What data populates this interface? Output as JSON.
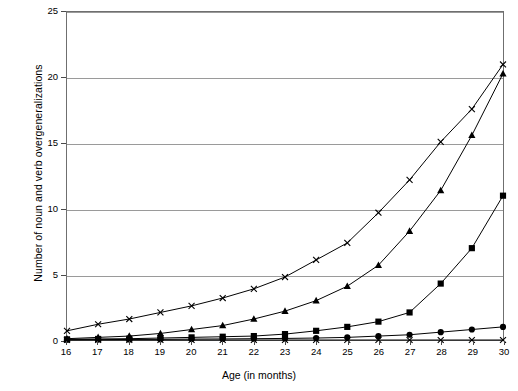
{
  "chart_data": {
    "type": "line",
    "title": "",
    "xlabel": "Age (in months)",
    "ylabel": "Number of noun and verb overgeneralizations",
    "x": [
      16,
      17,
      18,
      19,
      20,
      21,
      22,
      23,
      24,
      25,
      26,
      27,
      28,
      29,
      30
    ],
    "xlim": [
      16,
      30
    ],
    "ylim": [
      0,
      25
    ],
    "ytick_labels": [
      "0",
      "5",
      "10",
      "15",
      "20",
      "25"
    ],
    "ytick_values": [
      0,
      5,
      10,
      15,
      20,
      25
    ],
    "xtick_labels": [
      "16",
      "17",
      "18",
      "19",
      "20",
      "21",
      "22",
      "23",
      "24",
      "25",
      "26",
      "27",
      "28",
      "29",
      "30"
    ],
    "grid": "horizontal",
    "legend": "none",
    "series": [
      {
        "name": "series-cross-upper",
        "marker": "x",
        "values": [
          0.7,
          1.2,
          1.6,
          2.1,
          2.6,
          3.2,
          3.9,
          4.8,
          6.1,
          7.4,
          9.7,
          12.2,
          15.1,
          17.6,
          21.0
        ]
      },
      {
        "name": "series-triangle",
        "marker": "triangle",
        "values": [
          0.1,
          0.2,
          0.3,
          0.5,
          0.8,
          1.1,
          1.6,
          2.2,
          3.0,
          4.1,
          5.7,
          8.3,
          11.4,
          15.6,
          20.3
        ]
      },
      {
        "name": "series-square",
        "marker": "square",
        "values": [
          0.05,
          0.08,
          0.1,
          0.15,
          0.2,
          0.25,
          0.3,
          0.45,
          0.7,
          1.0,
          1.4,
          2.1,
          4.3,
          7.0,
          11.0
        ]
      },
      {
        "name": "series-circle",
        "marker": "circle",
        "values": [
          0.02,
          0.03,
          0.04,
          0.05,
          0.07,
          0.08,
          0.1,
          0.12,
          0.15,
          0.2,
          0.3,
          0.4,
          0.6,
          0.8,
          1.0
        ]
      },
      {
        "name": "series-cross-baseline",
        "marker": "x",
        "values": [
          0,
          0,
          0,
          0,
          0,
          0,
          0,
          0,
          0,
          0,
          0,
          0,
          0,
          0,
          0
        ]
      }
    ],
    "colors": {
      "line": "#000000",
      "marker": "#000000",
      "grid": "#9a9a9a",
      "frame": "#6f6f6f",
      "background": "#ffffff"
    }
  }
}
